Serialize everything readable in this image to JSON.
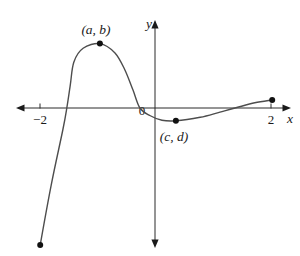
{
  "figure": {
    "background": "#ffffff",
    "axis_color": "#2b2b2b",
    "curve_color": "#4d4d4d",
    "point_color": "#111111",
    "labels": {
      "x_axis": "x",
      "y_axis": "y",
      "origin": "0",
      "tick_neg2": "−2",
      "tick_pos2": "2",
      "max_point": "(a, b)",
      "min_point": "(c, d)"
    }
  },
  "chart_data": {
    "type": "line",
    "xlabel": "x",
    "ylabel": "y",
    "x_ticks": [
      -2,
      2
    ],
    "x_tick_labels": [
      "−2",
      "2"
    ],
    "xlim": [
      -2.4,
      2.35
    ],
    "ylim": [
      -2.45,
      1.55
    ],
    "grid": false,
    "legend": false,
    "x_intercepts": [
      -1.52,
      -0.26,
      1.38
    ],
    "curve_points": [
      [
        -1.98,
        -2.36
      ],
      [
        -1.79,
        -1.33
      ],
      [
        -1.59,
        -0.38
      ],
      [
        -1.52,
        0.0
      ],
      [
        -1.46,
        0.4
      ],
      [
        -1.4,
        0.79
      ],
      [
        -1.24,
        1.03
      ],
      [
        -0.95,
        1.11
      ],
      [
        -0.69,
        0.95
      ],
      [
        -0.52,
        0.66
      ],
      [
        -0.38,
        0.31
      ],
      [
        -0.26,
        0.0
      ],
      [
        -0.09,
        -0.13
      ],
      [
        0.12,
        -0.21
      ],
      [
        0.36,
        -0.22
      ],
      [
        0.78,
        -0.16
      ],
      [
        1.12,
        -0.07
      ],
      [
        1.38,
        0.0
      ],
      [
        1.72,
        0.09
      ],
      [
        2.02,
        0.14
      ]
    ],
    "marked_points": [
      {
        "x": -1.98,
        "y": -2.36,
        "label": "",
        "role": "curve-start-endpoint"
      },
      {
        "x": -0.95,
        "y": 1.11,
        "label": "(a, b)",
        "role": "local-maximum"
      },
      {
        "x": 0.36,
        "y": -0.22,
        "label": "(c, d)",
        "role": "local-minimum"
      },
      {
        "x": 2.02,
        "y": 0.14,
        "label": "",
        "role": "curve-end-endpoint"
      }
    ]
  }
}
